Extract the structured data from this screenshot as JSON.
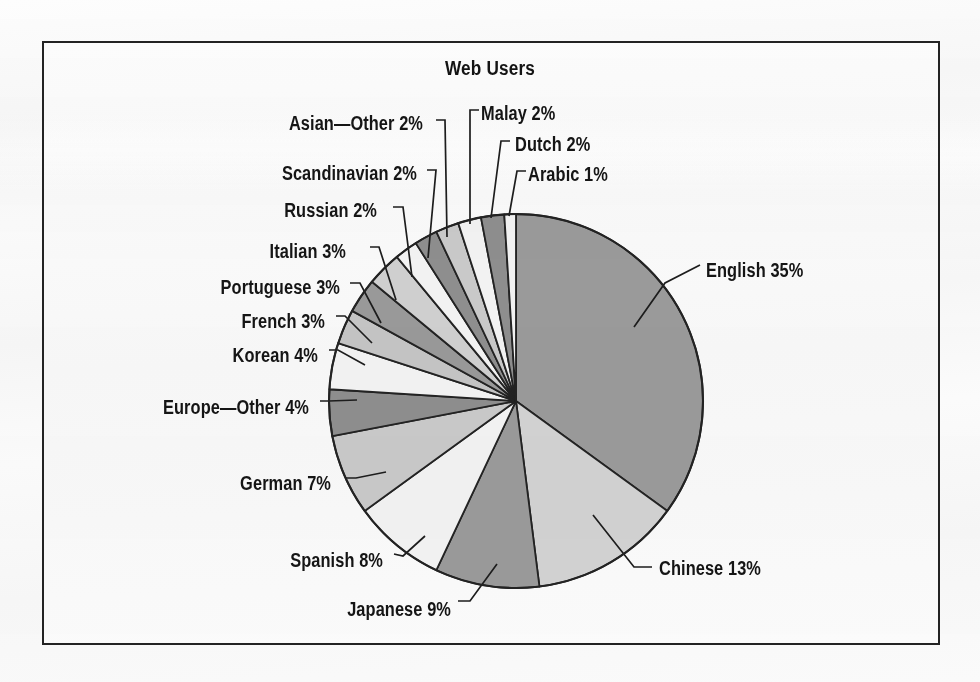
{
  "chart_data": {
    "type": "pie",
    "title": "Web Users",
    "xlabel": "",
    "ylabel": "",
    "legend_position": "none",
    "grid": false,
    "units": "percent",
    "categories": [
      "English",
      "Chinese",
      "Japanese",
      "Spanish",
      "German",
      "Europe—Other",
      "Korean",
      "French",
      "Portuguese",
      "Italian",
      "Russian",
      "Scandinavian",
      "Asian—Other",
      "Malay",
      "Dutch",
      "Arabic"
    ],
    "values": [
      35,
      13,
      9,
      8,
      7,
      4,
      4,
      3,
      3,
      3,
      2,
      2,
      2,
      2,
      2,
      1
    ],
    "labels": [
      "English 35%",
      "Chinese 13%",
      "Japanese 9%",
      "Spanish 8%",
      "German 7%",
      "Europe—Other 4%",
      "Korean 4%",
      "French 3%",
      "Portuguese 3%",
      "Italian 3%",
      "Russian 2%",
      "Scandinavian 2%",
      "Asian—Other 2%",
      "Malay 2%",
      "Dutch 2%",
      "Arabic 1%"
    ],
    "slice_colors": [
      "#9a9a9a",
      "#d2d2d2",
      "#9a9a9a",
      "#f2f2f2",
      "#c9c9c9",
      "#8e8e8e",
      "#f2f2f2",
      "#c4c4c4",
      "#999999",
      "#cfcfcf",
      "#f2f2f2",
      "#8e8e8e",
      "#c9c9c9",
      "#f2f2f2",
      "#8e8e8e",
      "#f2f2f2"
    ],
    "total": 100
  },
  "chart": {
    "title": "Web Users",
    "outline_color": "#232323",
    "leader_color": "#1d1d1d",
    "frame_color": "#232323",
    "background": "#fafafa",
    "center_x": 516,
    "center_y": 401,
    "radius": 187,
    "start_angle_deg": -90
  },
  "labels": [
    {
      "id": "english",
      "text": "English 35%",
      "x": 706,
      "y": 271,
      "side": "right"
    },
    {
      "id": "chinese",
      "text": "Chinese 13%",
      "x": 659,
      "y": 569,
      "side": "right"
    },
    {
      "id": "japanese",
      "text": "Japanese 9%",
      "x": 451,
      "y": 610,
      "side": "left"
    },
    {
      "id": "spanish",
      "text": "Spanish 8%",
      "x": 383,
      "y": 561,
      "side": "left"
    },
    {
      "id": "german",
      "text": "German 7%",
      "x": 331,
      "y": 484,
      "side": "left"
    },
    {
      "id": "europe-other",
      "text": "Europe—Other 4%",
      "x": 309,
      "y": 408,
      "side": "left"
    },
    {
      "id": "korean",
      "text": "Korean 4%",
      "x": 318,
      "y": 356,
      "side": "left"
    },
    {
      "id": "french",
      "text": "French 3%",
      "x": 325,
      "y": 322,
      "side": "left"
    },
    {
      "id": "portuguese",
      "text": "Portuguese 3%",
      "x": 340,
      "y": 288,
      "side": "left"
    },
    {
      "id": "italian",
      "text": "Italian 3%",
      "x": 346,
      "y": 252,
      "side": "left"
    },
    {
      "id": "russian",
      "text": "Russian 2%",
      "x": 377,
      "y": 211,
      "side": "left"
    },
    {
      "id": "scandinavian",
      "text": "Scandinavian 2%",
      "x": 417,
      "y": 174,
      "side": "left"
    },
    {
      "id": "asian-other",
      "text": "Asian—Other 2%",
      "x": 423,
      "y": 124,
      "side": "left"
    },
    {
      "id": "malay",
      "text": "Malay 2%",
      "x": 481,
      "y": 114,
      "side": "right"
    },
    {
      "id": "dutch",
      "text": "Dutch 2%",
      "x": 515,
      "y": 145,
      "side": "right"
    },
    {
      "id": "arabic",
      "text": "Arabic 1%",
      "x": 528,
      "y": 175,
      "side": "right"
    }
  ],
  "leaders": [
    {
      "id": "english",
      "points": "634,327 665,283 700,265"
    },
    {
      "id": "chinese",
      "points": "593,515 634,567 652,567"
    },
    {
      "id": "japanese",
      "points": "497,564 470,601 458,601"
    },
    {
      "id": "spanish",
      "points": "425,536 403,556 394,554"
    },
    {
      "id": "german",
      "points": "386,472 356,478 345,478"
    },
    {
      "id": "europe-other",
      "points": "357,400 329,401 320,401"
    },
    {
      "id": "korean",
      "points": "365,365 338,350 329,350"
    },
    {
      "id": "french",
      "points": "372,343 345,316 336,316"
    },
    {
      "id": "portuguese",
      "points": "381,323 360,283 350,283"
    },
    {
      "id": "italian",
      "points": "396,300 379,247 370,247"
    },
    {
      "id": "russian",
      "points": "412,277 403,207 393,207"
    },
    {
      "id": "scandinavian",
      "points": "428,258 436,170 427,170"
    },
    {
      "id": "asian-other",
      "points": "447,237 445,120 436,120"
    },
    {
      "id": "malay",
      "points": "470,224 470,110 479,110"
    },
    {
      "id": "dutch",
      "points": "491,218 501,141 510,141"
    },
    {
      "id": "arabic",
      "points": "509,216 517,171 526,171"
    }
  ]
}
